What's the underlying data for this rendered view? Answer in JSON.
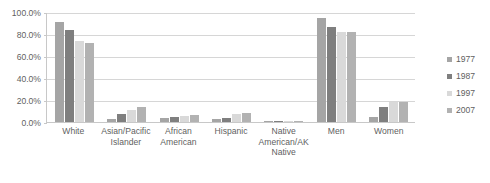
{
  "chart_data": {
    "type": "bar",
    "title": "",
    "subtitle": "",
    "xlabel": "",
    "ylabel": "",
    "ylim": [
      0,
      100
    ],
    "grid": true,
    "legend_position": "right",
    "y_tick_labels": [
      "100.0%",
      "80.0%",
      "60.0%",
      "40.0%",
      "20.0%",
      "0.0%"
    ],
    "y_tick_values": [
      100,
      80,
      60,
      40,
      20,
      0
    ],
    "categories": [
      "White",
      "Asian/Pacific Islander",
      "African American",
      "Hispanic",
      "Native American/AK Native",
      "Men",
      "Women"
    ],
    "series": [
      {
        "name": "1977",
        "color": "#a5a5a5",
        "values": [
          91.0,
          2.5,
          4.0,
          2.5,
          0.5,
          95.0,
          5.0
        ]
      },
      {
        "name": "1987",
        "color": "#7f7f7f",
        "values": [
          83.5,
          7.0,
          5.0,
          4.0,
          0.5,
          86.0,
          13.5
        ]
      },
      {
        "name": "1997",
        "color": "#d9d9d9",
        "values": [
          73.5,
          11.0,
          5.5,
          7.5,
          0.5,
          81.5,
          18.5
        ]
      },
      {
        "name": "2007",
        "color": "#b2b2b2",
        "values": [
          72.0,
          14.0,
          6.0,
          8.0,
          0.5,
          81.5,
          18.5
        ]
      }
    ]
  },
  "legend": {
    "items": [
      {
        "label": "1977",
        "color": "#a5a5a5"
      },
      {
        "label": "1987",
        "color": "#7f7f7f"
      },
      {
        "label": "1997",
        "color": "#d9d9d9"
      },
      {
        "label": "2007",
        "color": "#b2b2b2"
      }
    ]
  },
  "colors": {
    "axis": "#c8c8c8",
    "gridline": "#d6d6d6",
    "text": "#5f5f5f",
    "background": "#ffffff"
  }
}
